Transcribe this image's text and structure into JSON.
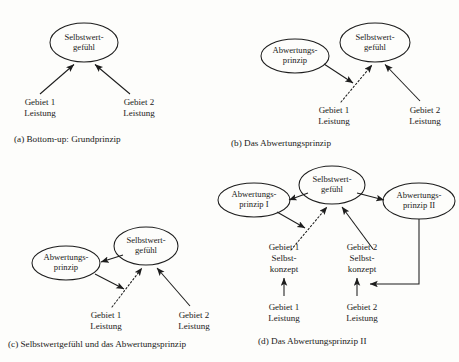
{
  "figure": {
    "background": "#fdfdfb",
    "ink": "#1d1d1d",
    "language": "de"
  },
  "panels": [
    {
      "id": "a",
      "caption": "(a) Bottom-up: Grundprinzip",
      "nodes": {
        "selbstwert": {
          "line1": "Selbstwert-",
          "line2": "gefühl"
        },
        "gebiet1": {
          "line1": "Gebiet 1",
          "line2": "Leistung"
        },
        "gebiet2": {
          "line1": "Gebiet 2",
          "line2": "Leistung"
        }
      }
    },
    {
      "id": "b",
      "caption": "(b) Das Abwertungsprinzip",
      "nodes": {
        "abwertung": {
          "line1": "Abwertungs-",
          "line2": "prinzip"
        },
        "selbstwert": {
          "line1": "Selbstwert-",
          "line2": "gefühl"
        },
        "gebiet1": {
          "line1": "Gebiet 1",
          "line2": "Leistung"
        },
        "gebiet2": {
          "line1": "Gebiet 2",
          "line2": "Leistung"
        }
      }
    },
    {
      "id": "c",
      "caption": "(c) Selbstwertgefühl und das Abwertungsprinzip",
      "nodes": {
        "abwertung": {
          "line1": "Abwertungs-",
          "line2": "prinzip"
        },
        "selbstwert": {
          "line1": "Selbstwert-",
          "line2": "gefühl"
        },
        "gebiet1": {
          "line1": "Gebiet 1",
          "line2": "Leistung"
        },
        "gebiet2": {
          "line1": "Gebiet 2",
          "line2": "Leistung"
        }
      }
    },
    {
      "id": "d",
      "caption": "(d) Das Abwertungsprinzip II",
      "nodes": {
        "abwertung1": {
          "line1": "Abwertungs-",
          "line2": "prinzip I"
        },
        "abwertung2": {
          "line1": "Abwertungs-",
          "line2": "prinzip II"
        },
        "selbstwert": {
          "line1": "Selbstwert-",
          "line2": "gefühl"
        },
        "konzept1": {
          "line1": "Gebiet 1",
          "line2": "Selbst-",
          "line3": "konzept"
        },
        "konzept2": {
          "line1": "Gebiet 2",
          "line2": "Selbst-",
          "line3": "konzept"
        },
        "gebiet1": {
          "line1": "Gebiet 1",
          "line2": "Leistung"
        },
        "gebiet2": {
          "line1": "Gebiet 2",
          "line2": "Leistung"
        }
      }
    }
  ]
}
